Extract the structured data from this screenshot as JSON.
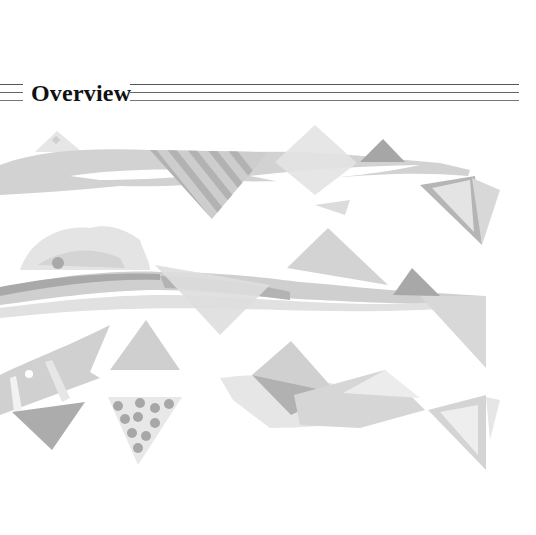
{
  "heading": {
    "title": "Overview"
  },
  "illustration": {
    "description": "Abstract grayscale illustration of flowing bands and geometric triangles",
    "palette": {
      "lightest": "#ececec",
      "light": "#dcdcdc",
      "mid": "#c8c8c8",
      "dark": "#aaaaaa",
      "darkest": "#969696"
    }
  }
}
